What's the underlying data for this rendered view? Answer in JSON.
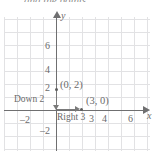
{
  "header": {
    "cutoff_text": "and the points."
  },
  "axes": {
    "x_letter": "x",
    "y_letter": "y"
  },
  "ticks": {
    "x": [
      {
        "label": "–2",
        "value": -2,
        "left": 20,
        "top": 114
      },
      {
        "label": "3",
        "value": 3,
        "left": 89,
        "top": 113
      },
      {
        "label": "4",
        "value": 4,
        "left": 102,
        "top": 113
      },
      {
        "label": "6",
        "value": 6,
        "left": 128,
        "top": 113
      }
    ],
    "y": [
      {
        "label": "6",
        "value": 6,
        "left": 45,
        "top": 40
      },
      {
        "label": "4",
        "value": 4,
        "left": 45,
        "top": 64
      },
      {
        "label": "2",
        "value": 2,
        "left": 45,
        "top": 82
      },
      {
        "label": "–2",
        "value": -2,
        "left": 40,
        "top": 125
      }
    ]
  },
  "points": [
    {
      "name": "y-intercept",
      "label": "(0, 2)",
      "x": 0,
      "y": 2,
      "dot_left": 55,
      "dot_top": 88,
      "label_left": 60,
      "label_top": 79
    },
    {
      "name": "x-intercept",
      "label": "(3, 0)",
      "x": 3,
      "y": 0,
      "dot_left": 80,
      "dot_top": 108,
      "label_left": 86,
      "label_top": 95
    }
  ],
  "annotations": [
    {
      "name": "down-2",
      "label": "Down 2",
      "left": 14,
      "top": 94
    },
    {
      "name": "right-3",
      "label": "Right 3",
      "left": 57,
      "top": 112
    }
  ],
  "colors": {
    "grid": "#e2e2e4",
    "axis": "#6f6f70",
    "text": "#6b6b6b",
    "point": "#5d5d5d",
    "background": "#ffffff"
  },
  "chart_data": {
    "type": "scatter",
    "title": "",
    "xlabel": "x",
    "ylabel": "y",
    "xlim": [
      -4,
      7
    ],
    "ylim": [
      -3,
      8
    ],
    "grid": true,
    "legend": "none",
    "xticks": [
      -2,
      3,
      4,
      6
    ],
    "yticks": [
      -2,
      2,
      4,
      6
    ],
    "points": [
      {
        "x": 0,
        "y": 2,
        "label": "(0, 2)"
      },
      {
        "x": 3,
        "y": 0,
        "label": "(3, 0)"
      }
    ],
    "annotations": [
      {
        "text": "Down 2",
        "from": [
          0,
          2
        ],
        "to": [
          0,
          0
        ],
        "direction": "down",
        "magnitude": 2
      },
      {
        "text": "Right 3",
        "from": [
          0,
          0
        ],
        "to": [
          3,
          0
        ],
        "direction": "right",
        "magnitude": 3
      }
    ]
  }
}
